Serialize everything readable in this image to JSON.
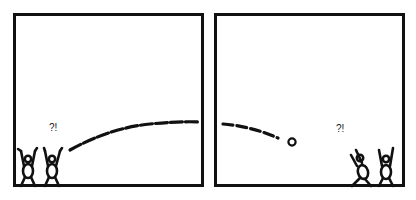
{
  "comic": {
    "panels": [
      {
        "id": "panel-1",
        "exclamation": "?!",
        "figures": 2,
        "pose": "arms-raised-cheering"
      },
      {
        "id": "panel-2",
        "exclamation": "?!",
        "figures": 2,
        "pose": "one-stumbling-one-arms-raised"
      }
    ],
    "colors": {
      "ink": "#111111",
      "background": "#ffffff"
    }
  }
}
